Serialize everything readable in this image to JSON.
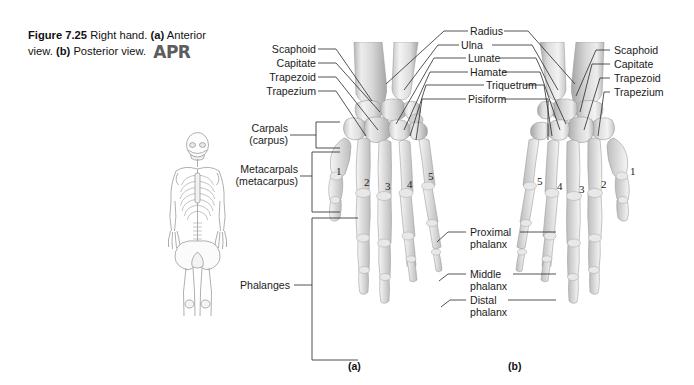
{
  "figure": {
    "number": "Figure 7.25",
    "title": "Right hand.",
    "part_a": "(a)",
    "part_a_text": "Anterior view.",
    "part_b": "(b)",
    "part_b_text": "Posterior view.",
    "logo": "APR"
  },
  "panels": {
    "a_label": "(a)",
    "b_label": "(b)"
  },
  "left_labels": [
    {
      "text": "Scaphoid"
    },
    {
      "text": "Capitate"
    },
    {
      "text": "Trapezoid"
    },
    {
      "text": "Trapezium"
    }
  ],
  "bracket_labels": [
    {
      "line1": "Carpals",
      "line2": "(carpus)"
    },
    {
      "line1": "Metacarpals",
      "line2": "(metacarpus)"
    },
    {
      "line1": "Phalanges",
      "line2": ""
    }
  ],
  "center_labels": [
    {
      "text": "Radius"
    },
    {
      "text": "Ulna"
    },
    {
      "text": "Lunate"
    },
    {
      "text": "Hamate"
    },
    {
      "text": "Triquetrum"
    },
    {
      "text": "Pisiform"
    }
  ],
  "right_labels": [
    {
      "text": "Scaphoid"
    },
    {
      "text": "Capitate"
    },
    {
      "text": "Trapezoid"
    },
    {
      "text": "Trapezium"
    }
  ],
  "phalanx_labels": [
    {
      "line1": "Proximal",
      "line2": "phalanx"
    },
    {
      "line1": "Middle",
      "line2": "phalanx"
    },
    {
      "line1": "Distal",
      "line2": "phalanx"
    }
  ],
  "digits_anterior": [
    "1",
    "2",
    "3",
    "4",
    "5"
  ],
  "digits_posterior": [
    "5",
    "4",
    "3",
    "2",
    "1"
  ],
  "colors": {
    "background": "#ffffff",
    "text": "#1b1b1b",
    "leader_line": "#2a2a2a",
    "bone_light": "#f0f0f0",
    "bone_mid": "#c8c8c8",
    "bone_shadow": "#9a9a9a",
    "logo": "#5d5d5d"
  }
}
